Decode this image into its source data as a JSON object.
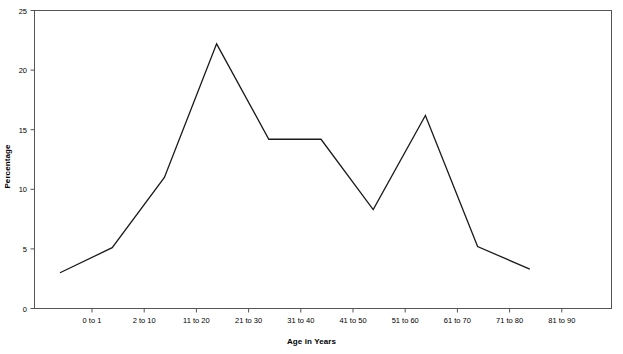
{
  "chart_data": {
    "type": "line",
    "title": "",
    "xlabel": "Age in Years",
    "ylabel": "Percentage",
    "categories": [
      "0 to 1",
      "2 to 10",
      "11 to 20",
      "21 to 30",
      "31 to 40",
      "41 to 50",
      "51 to 60",
      "61 to 70",
      "71 to 80",
      "81 to 90"
    ],
    "values": [
      3.0,
      5.1,
      11.0,
      22.2,
      14.2,
      14.2,
      8.3,
      16.2,
      5.2,
      3.3
    ],
    "ylim": [
      0,
      25
    ],
    "yticks": [
      0,
      5,
      10,
      15,
      20,
      25
    ],
    "ytick_labels": [
      "0",
      "5",
      "10",
      "15",
      "20",
      "25"
    ],
    "grid": false,
    "legend": null,
    "line_color": "#1a1a1a",
    "axis_color": "#555555",
    "background": "#ffffff"
  },
  "axes": {
    "x_title": "Age in Years",
    "y_title": "Percentage"
  }
}
